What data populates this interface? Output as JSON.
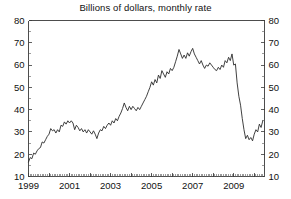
{
  "chart_data": {
    "type": "line",
    "title": "Billions of dollars, monthly rate",
    "xlabel": "",
    "ylabel": "",
    "ylim": [
      10,
      80
    ],
    "xlim": [
      1999.0,
      2010.5
    ],
    "grid": false,
    "legend": null,
    "y_ticks": [
      10,
      20,
      30,
      40,
      50,
      60,
      70,
      80
    ],
    "y_ticks_right": [
      10,
      20,
      30,
      40,
      50,
      60,
      70,
      80
    ],
    "y_tick_labels": [
      "10",
      "20",
      "30",
      "40",
      "50",
      "60",
      "70",
      "80"
    ],
    "y_tick_labels_right": [
      "10",
      "20",
      "30",
      "40",
      "50",
      "60",
      "70",
      "80"
    ],
    "x_ticks": [
      1999,
      2001,
      2003,
      2005,
      2007,
      2009
    ],
    "x_tick_labels": [
      "1999",
      "2001",
      "2003",
      "2005",
      "2007",
      "2009"
    ],
    "x_minor_tick_interval_months": 1,
    "series": [
      {
        "name": "Billions of dollars, monthly rate",
        "color": "#2b2b2b",
        "x": [
          1999.0,
          1999.083,
          1999.167,
          1999.25,
          1999.333,
          1999.417,
          1999.5,
          1999.583,
          1999.667,
          1999.75,
          1999.833,
          1999.917,
          2000.0,
          2000.083,
          2000.167,
          2000.25,
          2000.333,
          2000.417,
          2000.5,
          2000.583,
          2000.667,
          2000.75,
          2000.833,
          2000.917,
          2001.0,
          2001.083,
          2001.167,
          2001.25,
          2001.333,
          2001.417,
          2001.5,
          2001.583,
          2001.667,
          2001.75,
          2001.833,
          2001.917,
          2002.0,
          2002.083,
          2002.167,
          2002.25,
          2002.333,
          2002.417,
          2002.5,
          2002.583,
          2002.667,
          2002.75,
          2002.833,
          2002.917,
          2003.0,
          2003.083,
          2003.167,
          2003.25,
          2003.333,
          2003.417,
          2003.5,
          2003.583,
          2003.667,
          2003.75,
          2003.833,
          2003.917,
          2004.0,
          2004.083,
          2004.167,
          2004.25,
          2004.333,
          2004.417,
          2004.5,
          2004.583,
          2004.667,
          2004.75,
          2004.833,
          2004.917,
          2005.0,
          2005.083,
          2005.167,
          2005.25,
          2005.333,
          2005.417,
          2005.5,
          2005.583,
          2005.667,
          2005.75,
          2005.833,
          2005.917,
          2006.0,
          2006.083,
          2006.167,
          2006.25,
          2006.333,
          2006.417,
          2006.5,
          2006.583,
          2006.667,
          2006.75,
          2006.833,
          2006.917,
          2007.0,
          2007.083,
          2007.167,
          2007.25,
          2007.333,
          2007.417,
          2007.5,
          2007.583,
          2007.667,
          2007.75,
          2007.833,
          2007.917,
          2008.0,
          2008.083,
          2008.167,
          2008.25,
          2008.333,
          2008.417,
          2008.5,
          2008.583,
          2008.667,
          2008.75,
          2008.833,
          2008.917,
          2009.0,
          2009.083,
          2009.167,
          2009.25,
          2009.333,
          2009.417,
          2009.5,
          2009.583,
          2009.667,
          2009.75,
          2009.833,
          2009.917,
          2010.0,
          2010.083,
          2010.167,
          2010.25,
          2010.333,
          2010.417
        ],
        "values": [
          16.5,
          18.5,
          18.0,
          20.5,
          20.0,
          21.5,
          22.5,
          23.0,
          25.5,
          25.0,
          26.5,
          28.0,
          29.0,
          31.5,
          30.5,
          31.0,
          29.5,
          31.0,
          30.0,
          33.0,
          32.5,
          34.5,
          33.5,
          35.0,
          34.0,
          35.0,
          34.0,
          31.0,
          33.0,
          32.0,
          30.5,
          31.5,
          30.0,
          31.0,
          29.5,
          31.0,
          30.0,
          29.0,
          30.5,
          29.0,
          27.0,
          29.5,
          31.0,
          30.5,
          32.5,
          31.5,
          33.0,
          34.0,
          33.0,
          35.0,
          34.0,
          36.0,
          35.0,
          37.0,
          38.5,
          40.5,
          43.0,
          41.0,
          39.5,
          41.5,
          40.0,
          41.5,
          40.5,
          39.5,
          41.0,
          40.0,
          41.5,
          43.0,
          44.5,
          46.0,
          48.0,
          50.0,
          52.5,
          51.0,
          53.5,
          52.0,
          55.5,
          54.0,
          57.5,
          56.0,
          54.5,
          57.0,
          56.0,
          58.5,
          57.5,
          59.0,
          61.5,
          64.0,
          67.0,
          65.0,
          63.0,
          64.5,
          63.0,
          65.5,
          64.0,
          66.0,
          67.5,
          65.0,
          63.5,
          62.0,
          60.5,
          62.0,
          60.0,
          58.5,
          60.0,
          59.5,
          61.0,
          60.0,
          59.0,
          58.0,
          57.5,
          59.0,
          58.0,
          60.0,
          59.0,
          62.0,
          61.0,
          63.5,
          62.0,
          65.0,
          60.0,
          60.5,
          52.0,
          46.0,
          42.0,
          36.0,
          31.0,
          27.0,
          28.5,
          26.5,
          27.5,
          26.0,
          29.0,
          31.0,
          30.0,
          33.5,
          32.0,
          35.0
        ]
      }
    ],
    "annotations": []
  },
  "figure": {
    "background_color": "#ffffff",
    "line_color": "#2b2b2b",
    "axis_color": "#3a3a3a",
    "text_color": "#111111"
  }
}
